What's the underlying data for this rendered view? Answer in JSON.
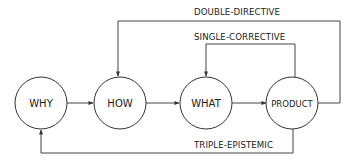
{
  "diagram": {
    "nodes": [
      {
        "id": "why",
        "label": "WHY"
      },
      {
        "id": "how",
        "label": "HOW"
      },
      {
        "id": "what",
        "label": "WHAT"
      },
      {
        "id": "product",
        "label": "PRODUCT"
      }
    ],
    "loops": {
      "double": {
        "label": "DOUBLE-DIRECTIVE",
        "from": "PRODUCT",
        "to": "HOW"
      },
      "single": {
        "label": "SINGLE-CORRECTIVE",
        "from": "PRODUCT",
        "to": "WHAT"
      },
      "triple": {
        "label": "TRIPLE-EPISTEMIC",
        "from": "PRODUCT",
        "to": "WHY"
      }
    },
    "flow": [
      "WHY",
      "HOW",
      "WHAT",
      "PRODUCT"
    ],
    "colors": {
      "stroke": "#333333",
      "text": "#222222",
      "background": "#ffffff"
    }
  }
}
